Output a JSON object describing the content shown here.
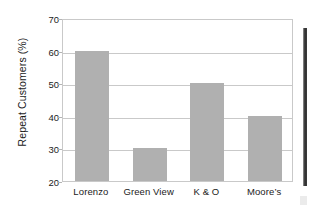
{
  "chart_data": {
    "type": "bar",
    "title": "",
    "xlabel": "",
    "ylabel": "Repeat Customers (%)",
    "categories": [
      "Lorenzo",
      "Green View",
      "K & O",
      "Moore’s"
    ],
    "values": [
      60,
      30,
      50,
      40
    ],
    "ylim": [
      20,
      70
    ],
    "yticks": [
      20,
      30,
      40,
      50,
      60,
      70
    ],
    "ytick_labels": [
      "20",
      "30",
      "40",
      "50",
      "60",
      "70"
    ],
    "grid": "horizontal",
    "legend": "none",
    "bar_color": "#b0b0b0",
    "frame_color": "#c9c9c9",
    "text_color": "#1b1b1b",
    "background": "#ffffff"
  }
}
